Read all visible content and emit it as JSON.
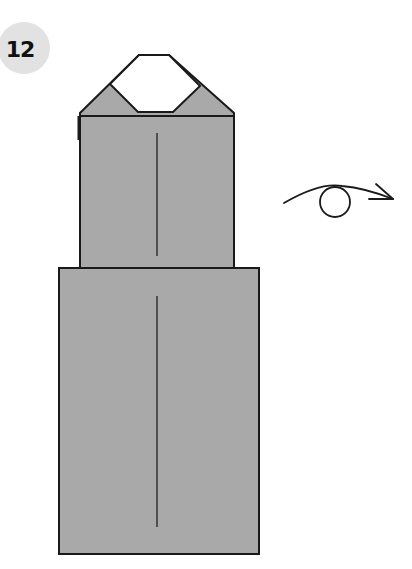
{
  "step": {
    "number": "12"
  },
  "diagram": {
    "type": "origami-fold-step",
    "fill_color": "#a9a9a9",
    "line_color": "#1a1a1a",
    "badge_color": "#e2e2e2",
    "shapes": {
      "top_outer_polygon": [
        [
          80,
          113
        ],
        [
          80,
          118
        ],
        [
          234,
          118
        ],
        [
          234,
          113
        ],
        [
          169,
          55
        ],
        [
          139,
          55
        ]
      ],
      "top_white_hexagon": [
        [
          139,
          55
        ],
        [
          169,
          55
        ],
        [
          200,
          86
        ],
        [
          173,
          112
        ],
        [
          138,
          112
        ],
        [
          110,
          84
        ]
      ],
      "upper_rect": {
        "x": 80,
        "y": 116,
        "w": 154,
        "h": 152
      },
      "lower_rect": {
        "x": 59,
        "y": 268,
        "w": 200,
        "h": 286
      },
      "upper_center_line": {
        "x": 157,
        "y1": 133,
        "y2": 256
      },
      "lower_center_line": {
        "x": 157,
        "y1": 296,
        "y2": 527
      }
    },
    "symbol": {
      "name": "turn-over-arrow",
      "meaning": "Turn the model over"
    }
  }
}
